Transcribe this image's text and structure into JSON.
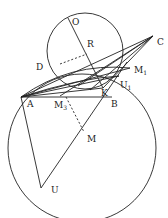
{
  "diagram": {
    "labels": {
      "O": "O",
      "R": "R",
      "C": "C",
      "D": "D",
      "M1": "M",
      "M1_sub": "1",
      "U1": "U",
      "U1_sub": "1",
      "K": "K",
      "A": "A",
      "M3": "M",
      "M3_sub": "3",
      "B": "B",
      "M": "M",
      "U": "U"
    },
    "points": {
      "O": [
        68,
        18
      ],
      "R": [
        87,
        54
      ],
      "C": [
        153,
        36
      ],
      "D": [
        48,
        70
      ],
      "M1": [
        130,
        68
      ],
      "U1": [
        119,
        76
      ],
      "K": [
        103,
        88
      ],
      "A": [
        21,
        97
      ],
      "M3": [
        66,
        97
      ],
      "B": [
        112,
        97
      ],
      "M": [
        84,
        132
      ],
      "U": [
        41,
        188
      ]
    },
    "stroke_color": "#222222"
  }
}
